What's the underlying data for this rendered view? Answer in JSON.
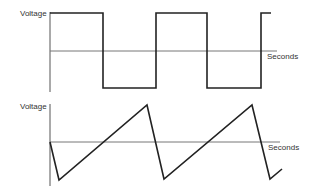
{
  "diagrams": [
    {
      "name": "square-wave",
      "y_label": "Voltage",
      "x_label": "Seconds",
      "axis": {
        "x": 50,
        "y_top": 12,
        "y_bottom": 92
      },
      "baseline": {
        "y": 51,
        "x_end": 277
      },
      "wave_points": "50,13 103,13 103,88 156,88 156,13 207,13 207,88 261,88 261,13 271,13",
      "colors": {
        "wave": "#222222",
        "axis": "#555555"
      }
    },
    {
      "name": "sawtooth-wave",
      "y_label": "Voltage",
      "x_label": "Seconds",
      "axis": {
        "x": 50,
        "y_top": 104,
        "y_bottom": 186
      },
      "baseline": {
        "y": 142,
        "x_end": 280
      },
      "wave_points": "50,142 59,180 147,105 164,179 252,105 270,179 282,169",
      "colors": {
        "wave": "#222222",
        "axis": "#555555"
      }
    }
  ]
}
